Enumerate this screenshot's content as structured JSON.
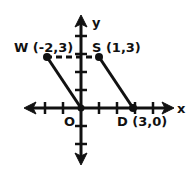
{
  "diagram": {
    "type": "coordinate-plane",
    "axes": {
      "x_label": "x",
      "y_label": "y",
      "origin_label": "O"
    },
    "points": [
      {
        "name": "W",
        "coords": "(-2,3)",
        "x": -2,
        "y": 3,
        "label": "W (-2,3)"
      },
      {
        "name": "S",
        "coords": "(1,3)",
        "x": 1,
        "y": 3,
        "label": "S (1,3)"
      },
      {
        "name": "O",
        "coords": "(0,0)",
        "x": 0,
        "y": 0,
        "label": "O"
      },
      {
        "name": "D",
        "coords": "(3,0)",
        "x": 3,
        "y": 0,
        "label": "D (3,0)"
      }
    ],
    "segments": [
      {
        "from": "W",
        "to": "S",
        "style": "dashed"
      },
      {
        "from": "W",
        "to": "O",
        "style": "solid"
      },
      {
        "from": "S",
        "to": "D",
        "style": "solid"
      }
    ]
  }
}
